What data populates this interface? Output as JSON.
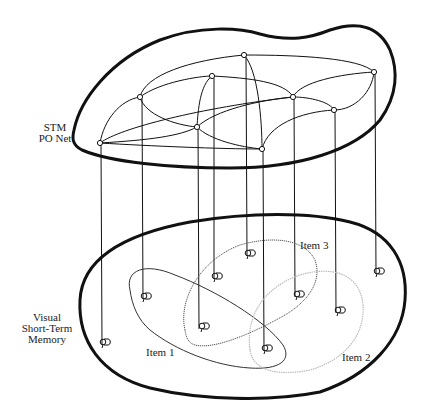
{
  "labels": {
    "stm_po_net_line1": "STM",
    "stm_po_net_line2": "PO Net",
    "vstm_line1": "Visual",
    "vstm_line2": "Short-Term",
    "vstm_line3": "Memory",
    "item1": "Item 1",
    "item2": "Item 2",
    "item3": "Item 3"
  },
  "colors": {
    "ink": "#111111",
    "item1_stroke": "#333333",
    "item2_stroke": "#bbbbbb",
    "item3_stroke": "#555555"
  },
  "po_net_nodes": [
    {
      "id": "A",
      "x": 100,
      "y": 143
    },
    {
      "id": "B",
      "x": 140,
      "y": 97
    },
    {
      "id": "C",
      "x": 197,
      "y": 127
    },
    {
      "id": "D",
      "x": 212,
      "y": 76
    },
    {
      "id": "E",
      "x": 244,
      "y": 55
    },
    {
      "id": "F",
      "x": 262,
      "y": 149
    },
    {
      "id": "G",
      "x": 293,
      "y": 97
    },
    {
      "id": "H",
      "x": 334,
      "y": 110
    },
    {
      "id": "I",
      "x": 374,
      "y": 72
    }
  ],
  "vstm_items": [
    {
      "from": "A",
      "x": 105,
      "y": 342
    },
    {
      "from": "B",
      "x": 146,
      "y": 296
    },
    {
      "from": "C",
      "x": 204,
      "y": 326
    },
    {
      "from": "D",
      "x": 217,
      "y": 276
    },
    {
      "from": "E",
      "x": 250,
      "y": 253
    },
    {
      "from": "F",
      "x": 267,
      "y": 348
    },
    {
      "from": "G",
      "x": 299,
      "y": 294
    },
    {
      "from": "H",
      "x": 340,
      "y": 310
    },
    {
      "from": "I",
      "x": 379,
      "y": 271
    }
  ]
}
